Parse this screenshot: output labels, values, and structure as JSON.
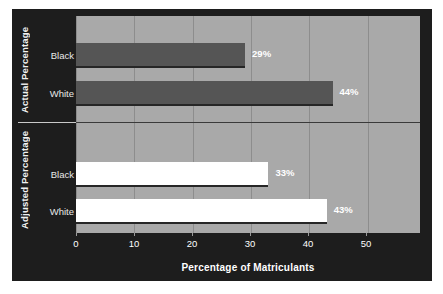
{
  "chart_data": {
    "type": "bar",
    "orientation": "horizontal",
    "title": "",
    "xlabel": "Percentage of Matriculants",
    "ylabel": "",
    "xlim": [
      0,
      59
    ],
    "xticks": [
      0,
      10,
      20,
      30,
      40,
      50
    ],
    "xtick_labels": [
      "0",
      "10",
      "20",
      "30",
      "40",
      "50"
    ],
    "grid": true,
    "legend": "none",
    "groups": [
      {
        "name": "Actual Percentage",
        "bar_color": "#555555",
        "categories": [
          "Black",
          "White"
        ],
        "values": [
          29,
          44
        ],
        "value_labels": [
          "29%",
          "44%"
        ]
      },
      {
        "name": "Adjusted Percentage",
        "bar_color": "#ffffff",
        "categories": [
          "Black",
          "White"
        ],
        "values": [
          33,
          43
        ],
        "value_labels": [
          "33%",
          "43%"
        ]
      }
    ],
    "colors": {
      "panel_background": "#1d1d1d",
      "plot_background": "#a9a9a9",
      "gridline": "#8d8d8d",
      "actual_bar": "#555555",
      "adjusted_bar": "#ffffff",
      "text": "#ffffff"
    }
  }
}
